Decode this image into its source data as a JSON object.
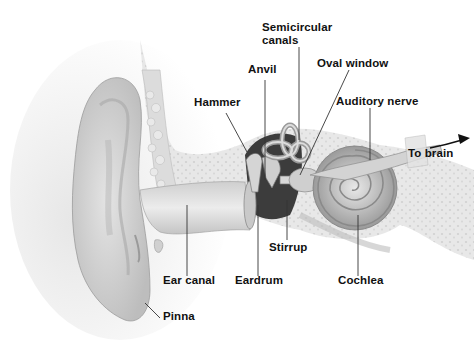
{
  "diagram": {
    "labels": [
      {
        "id": "semicircular-canals",
        "text_line1": "Semicircular",
        "text_line2": "canals"
      },
      {
        "id": "anvil",
        "text": "Anvil"
      },
      {
        "id": "oval-window",
        "text": "Oval window"
      },
      {
        "id": "hammer",
        "text": "Hammer"
      },
      {
        "id": "auditory-nerve",
        "text": "Auditory nerve"
      },
      {
        "id": "to-brain",
        "text": "To brain"
      },
      {
        "id": "stirrup",
        "text": "Stirrup"
      },
      {
        "id": "ear-canal",
        "text": "Ear canal"
      },
      {
        "id": "eardrum",
        "text": "Eardrum"
      },
      {
        "id": "cochlea",
        "text": "Cochlea"
      },
      {
        "id": "pinna",
        "text": "Pinna"
      }
    ],
    "colors": {
      "background": "#ffffff",
      "label_text": "#111111",
      "leader_line": "#333333",
      "tissue": "#d9d9d9",
      "bone": "#e6e6e6",
      "cavity": "#3a3a3a"
    }
  }
}
